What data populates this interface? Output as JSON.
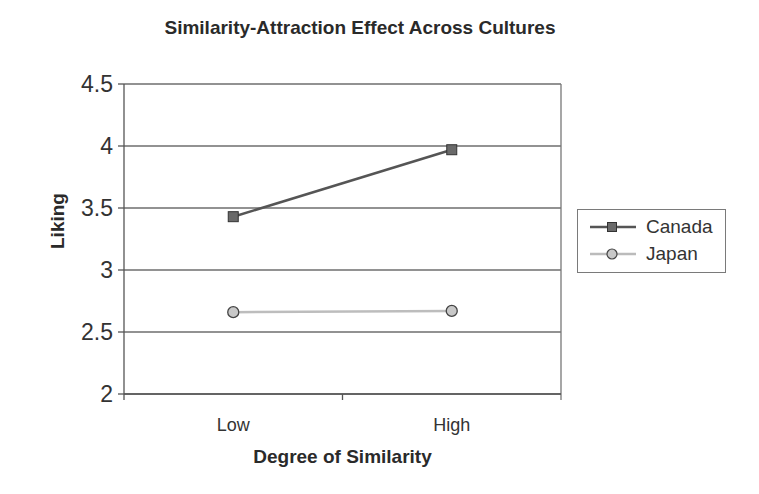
{
  "chart_data": {
    "type": "line",
    "title": "Similarity-Attraction Effect Across Cultures",
    "xlabel": "Degree of Similarity",
    "ylabel": "Liking",
    "categories": [
      "Low",
      "High"
    ],
    "series": [
      {
        "name": "Canada",
        "values": [
          3.43,
          3.97
        ],
        "color": "#555555",
        "marker": "square"
      },
      {
        "name": "Japan",
        "values": [
          2.66,
          2.67
        ],
        "color": "#b8b8b8",
        "marker": "circle"
      }
    ],
    "ylim": [
      2,
      4.5
    ],
    "yticks": [
      "2",
      "2.5",
      "3",
      "3.5",
      "4",
      "4.5"
    ],
    "grid": true,
    "legend_position": "right"
  },
  "labels": {
    "title": "Similarity-Attraction Effect Across Cultures",
    "xlabel": "Degree of Similarity",
    "ylabel": "Liking",
    "legend": [
      "Canada",
      "Japan"
    ]
  }
}
